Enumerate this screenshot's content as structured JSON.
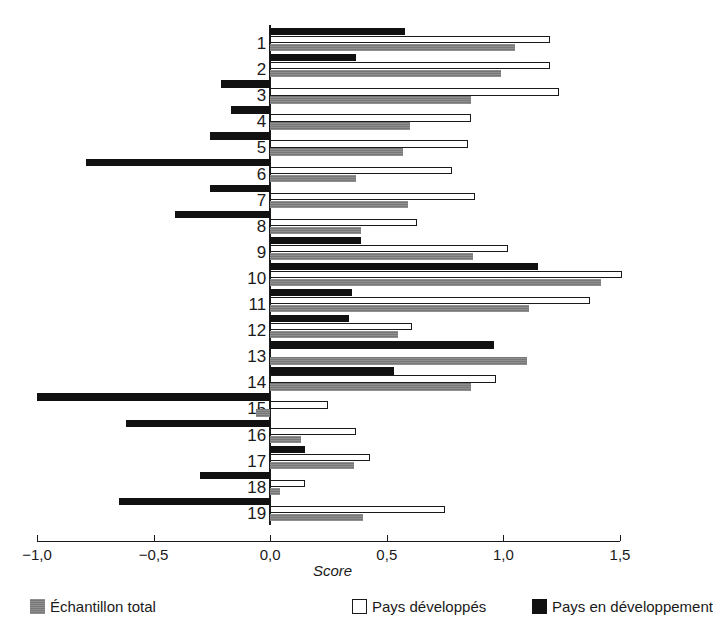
{
  "chart_data": {
    "type": "bar",
    "orientation": "horizontal",
    "title": "",
    "xlabel": "Score",
    "ylabel": "",
    "xlim": [
      -1.0,
      1.5
    ],
    "xticks": [
      -1.0,
      -0.5,
      0.0,
      0.5,
      1.0,
      1.5
    ],
    "xtick_labels": [
      "−1,0",
      "−0,5",
      "0,0",
      "0,5",
      "1,0",
      "1,5"
    ],
    "grid": false,
    "legend_position": "bottom",
    "categories": [
      "1",
      "2",
      "3",
      "4",
      "5",
      "6",
      "7",
      "8",
      "9",
      "10",
      "11",
      "12",
      "13",
      "14",
      "15",
      "16",
      "17",
      "18",
      "19"
    ],
    "series": [
      {
        "name": "Pays en développement",
        "color": "#111111",
        "values": [
          0.58,
          0.37,
          -0.21,
          -0.17,
          -0.26,
          -0.79,
          -0.26,
          -0.41,
          0.39,
          1.15,
          0.35,
          0.34,
          0.96,
          0.53,
          -1.0,
          -0.62,
          0.15,
          -0.3,
          -0.65
        ]
      },
      {
        "name": "Pays développés",
        "color": "#ffffff",
        "values": [
          1.2,
          1.2,
          1.24,
          0.86,
          0.85,
          0.78,
          0.88,
          0.63,
          1.02,
          1.51,
          1.37,
          0.61,
          0.0,
          0.97,
          0.25,
          0.37,
          0.43,
          0.15,
          0.75
        ]
      },
      {
        "name": "Échantillon total",
        "color": "#777777",
        "values": [
          1.05,
          0.99,
          0.86,
          0.6,
          0.57,
          0.37,
          0.59,
          0.39,
          0.87,
          1.42,
          1.11,
          0.55,
          1.1,
          0.86,
          -0.06,
          0.13,
          0.36,
          0.04,
          0.4
        ]
      }
    ]
  },
  "axis": {
    "title": "Score",
    "tick_labels": [
      "−1,0",
      "−0,5",
      "0,0",
      "0,5",
      "1,0",
      "1,5"
    ]
  },
  "legend": {
    "items": [
      {
        "label": "Échantillon total",
        "swatch": "total"
      },
      {
        "label": "Pays développés",
        "swatch": "developed"
      },
      {
        "label": "Pays en développement",
        "swatch": "dev"
      }
    ]
  }
}
